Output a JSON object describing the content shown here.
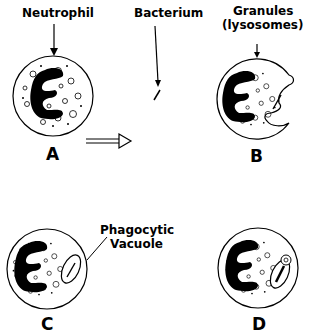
{
  "diagram": {
    "labels": {
      "neutrophil": "Neutrophil",
      "bacterium": "Bacterium",
      "granules_line1": "Granules",
      "granules_line2": "(lysosomes)",
      "vacuole_line1": "Phagocytic",
      "vacuole_line2": "Vacuole"
    },
    "panels": [
      {
        "id": "A",
        "label": "A"
      },
      {
        "id": "B",
        "label": "B"
      },
      {
        "id": "C",
        "label": "C"
      },
      {
        "id": "D",
        "label": "D"
      }
    ],
    "colors": {
      "ink": "#000000",
      "background": "#ffffff"
    }
  }
}
